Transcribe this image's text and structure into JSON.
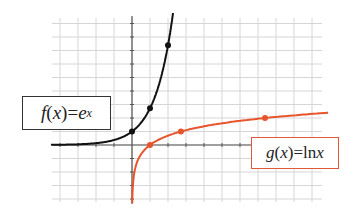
{
  "chart_data": {
    "type": "line",
    "title": "",
    "xlabel": "",
    "ylabel": "",
    "xlim": [
      -4.5,
      10.5
    ],
    "ylim": [
      -4.3,
      9
    ],
    "grid": true,
    "x_ticks": [
      -4,
      -3,
      -2,
      -1,
      1,
      2,
      3,
      4,
      5,
      6
    ],
    "y_ticks": [
      -4,
      -3,
      -2,
      -1,
      1,
      2,
      3,
      4,
      5,
      6,
      7,
      8,
      9
    ],
    "series": [
      {
        "name": "f(x) = e^x",
        "color": "#111111",
        "function": "exp",
        "marked_points": [
          [
            0,
            1
          ],
          [
            1,
            2.718
          ],
          [
            2,
            7.389
          ]
        ]
      },
      {
        "name": "g(x) = ln x",
        "color": "#e8542c",
        "function": "ln",
        "marked_points": [
          [
            1,
            0
          ],
          [
            2.718,
            1
          ],
          [
            7.389,
            2
          ]
        ]
      }
    ],
    "annotations": [
      {
        "text_func": "f",
        "text_arg": "x",
        "text_eq": "=",
        "text_base": "e",
        "text_exp": "x",
        "series": 0
      },
      {
        "text_func": "g",
        "text_arg": "x",
        "text_eq": "=",
        "text_fn": "ln",
        "text_var": "x",
        "series": 1
      }
    ]
  },
  "labels": {
    "f": {
      "func": "f",
      "open": "(",
      "arg": "x",
      "close": ")",
      "eq": " = ",
      "base": "e",
      "exp": "x"
    },
    "g": {
      "func": "g",
      "open": "(",
      "arg": "x",
      "close": ")",
      "eq": " = ",
      "fn": "ln",
      "var": " x"
    }
  },
  "colors": {
    "exp": "#111111",
    "ln": "#e8542c",
    "grid": "#d6d6d6",
    "axis": "#555555"
  }
}
